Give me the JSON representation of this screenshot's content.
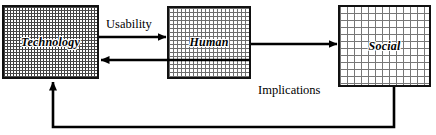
{
  "diagram": {
    "nodes": [
      {
        "id": "technology",
        "label": "Technology",
        "fill": "dense-checker",
        "border_color": "#111111",
        "x": 2,
        "y": 5,
        "width": 97,
        "height": 74
      },
      {
        "id": "human",
        "label": "Human",
        "fill": "medium-checker",
        "border_color": "#111111",
        "x": 167,
        "y": 6,
        "width": 84,
        "height": 73
      },
      {
        "id": "social",
        "label": "Social",
        "fill": "sparse-dots",
        "border_color": "#111111",
        "x": 338,
        "y": 5,
        "width": 93,
        "height": 82
      }
    ],
    "edges": [
      {
        "id": "technology-to-human",
        "label": "Usability",
        "from": "technology",
        "to": "human",
        "direction": "right"
      },
      {
        "id": "human-to-technology",
        "label": "",
        "from": "human",
        "to": "technology",
        "direction": "left"
      },
      {
        "id": "human-to-social",
        "label": "",
        "from": "human",
        "to": "social",
        "direction": "right"
      },
      {
        "id": "social-to-technology",
        "label": "Implications",
        "from": "social",
        "to": "technology",
        "direction": "feedback-loop"
      }
    ],
    "labels": {
      "usability": "Usability",
      "implications": "Implications"
    },
    "line_color": "#000000"
  }
}
